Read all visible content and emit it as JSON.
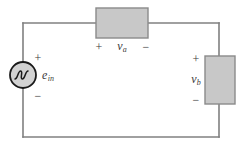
{
  "figure": {
    "type": "electrical-circuit-schematic",
    "colors": {
      "wire": "#808080",
      "box_fill": "#c8c8c8",
      "box_border": "#8a8a8a",
      "source_outline": "#1a1a1a",
      "text": "#3a3a3a",
      "background": "#ffffff"
    }
  },
  "source": {
    "name": "ac-voltage-source",
    "label": "e",
    "subscript": "in",
    "plus_sign": "+",
    "minus_sign": "−",
    "symbol": "sine-wave-in-circle"
  },
  "element_a": {
    "name": "element-a",
    "label": "v",
    "subscript": "a",
    "plus_sign": "+",
    "minus_sign": "−",
    "orientation": "horizontal",
    "polarity": "plus-left-minus-right"
  },
  "element_b": {
    "name": "element-b",
    "label": "v",
    "subscript": "b",
    "plus_sign": "+",
    "minus_sign": "−",
    "orientation": "vertical",
    "polarity": "plus-top-minus-bottom"
  }
}
